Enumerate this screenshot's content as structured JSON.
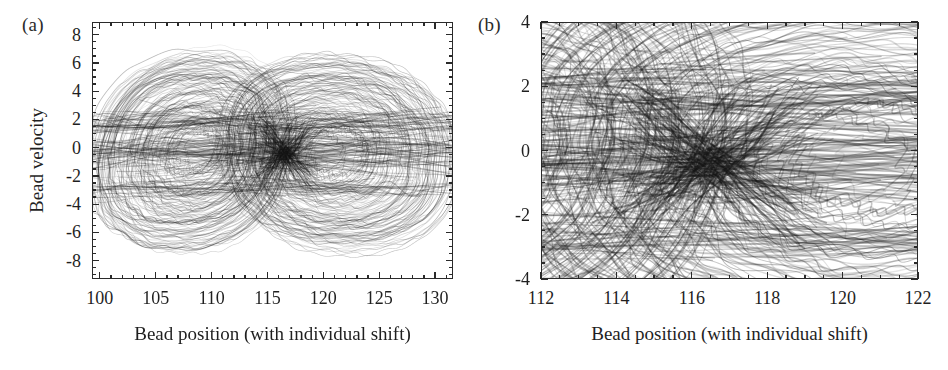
{
  "figure": {
    "width": 948,
    "height": 370,
    "background": "#ffffff",
    "ink_color": "#2a2a2a"
  },
  "panels": [
    {
      "key": "a",
      "label": "(a)",
      "xlabel": "Bead position (with individual shift)",
      "ylabel": "Bead velocity",
      "xlim": [
        99.3,
        131.6
      ],
      "ylim": [
        -9.3,
        8.9
      ],
      "x_major_ticks": [
        100,
        105,
        110,
        115,
        120,
        125,
        130
      ],
      "x_major_labels": [
        "100",
        "105",
        "110",
        "115",
        "120",
        "125",
        "130"
      ],
      "x_minor_step": 1,
      "y_major_ticks": [
        -8,
        -6,
        -4,
        -2,
        0,
        2,
        4,
        6,
        8
      ],
      "y_major_labels": [
        "-8",
        "-6",
        "-4",
        "-2",
        "0",
        "2",
        "4",
        "6",
        "8"
      ],
      "y_minor_step": 0.5,
      "frame": {
        "left": 92,
        "top": 22,
        "width": 361,
        "height": 257
      }
    },
    {
      "key": "b",
      "label": "(b)",
      "xlabel": "Bead position (with individual shift)",
      "ylabel": "",
      "xlim": [
        112,
        122
      ],
      "ylim": [
        -4,
        4
      ],
      "x_major_ticks": [
        112,
        114,
        116,
        118,
        120,
        122
      ],
      "x_major_labels": [
        "112",
        "114",
        "116",
        "118",
        "120",
        "122"
      ],
      "x_minor_step": 0.5,
      "y_major_ticks": [
        -4,
        -2,
        0,
        2,
        4
      ],
      "y_major_labels": [
        "-4",
        "-2",
        "0",
        "2",
        "4"
      ],
      "y_minor_step": 0.5,
      "frame": {
        "left": 541,
        "top": 22,
        "width": 377,
        "height": 257
      }
    }
  ],
  "chart_data": {
    "type": "line",
    "title": "",
    "subtitle": "",
    "xlabel": "Bead position (with individual shift)",
    "ylabel": "Bead velocity",
    "legend": [],
    "grid": false,
    "panels": [
      {
        "key": "a",
        "xlim": [
          99.3,
          131.6
        ],
        "ylim": [
          -9.3,
          8.9
        ],
        "xticks": [
          100,
          105,
          110,
          115,
          120,
          125,
          130
        ],
        "yticks": [
          -8,
          -6,
          -4,
          -2,
          0,
          2,
          4,
          6,
          8
        ],
        "trajectory_count": 220,
        "envelope_notes": "Trajectories form nested closed loops. Outer envelope spans x from about 100 to 131 and velocity from about -8.6 to 7.6. Two dominant loop families overlap with centers near x=108 and x=120, crossing densely near x=116.",
        "loop_families": [
          {
            "center_x": 108.5,
            "center_y": -0.2,
            "x_amplitude_range": [
              1.5,
              9.0
            ],
            "y_amplitude_range": [
              1.2,
              8.0
            ],
            "count": 110
          },
          {
            "center_x": 120.5,
            "center_y": -0.3,
            "x_amplitude_range": [
              1.5,
              10.5
            ],
            "y_amplitude_range": [
              1.2,
              7.8
            ],
            "count": 110
          }
        ]
      },
      {
        "key": "b",
        "xlim": [
          112,
          122
        ],
        "ylim": [
          -4,
          4
        ],
        "xticks": [
          112,
          114,
          116,
          118,
          120,
          122
        ],
        "yticks": [
          -4,
          -2,
          0,
          2,
          4
        ],
        "trajectory_count": 220,
        "envelope_notes": "Magnified window of panel (a). Dense braided bands near velocity +2 and near 0, a sharp crossing knot near x=116.5, and fine quasi-periodic ripples along the near-zero velocity band between x=112 and x=118."
      }
    ]
  }
}
